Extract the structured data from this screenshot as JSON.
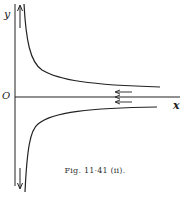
{
  "figure": {
    "caption": "Fig. 11·41 (ii).",
    "axis_labels": {
      "y": "y",
      "x": "x",
      "origin": "O"
    },
    "colors": {
      "ink": "#222222",
      "background": "#ffffff"
    },
    "elements": [
      "upper hyperbola-like branch asymptotic to x-axis from above, going up along y-axis",
      "lower branch asymptotic to x-axis from below, going down along y-axis",
      "arrows on upper branch near y-axis pointing up, lower branch pointing down",
      "leftward arrows near x-axis at the right"
    ]
  }
}
